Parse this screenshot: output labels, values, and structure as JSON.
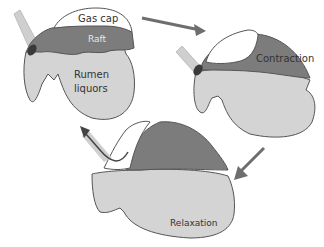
{
  "diagram": {
    "colors": {
      "liquor": "#d4d4d4",
      "raft": "#7c7c7c",
      "gas": "#ffffff",
      "esophagus": "#cfcfcf",
      "cardia": "#3a3a3a",
      "outline": "#555555",
      "arrow": "#6e6e6e",
      "text": "#333333",
      "raft_text": "#e6e6e6"
    },
    "stages": [
      {
        "name": "Resting",
        "labels": {
          "gas": "Gas cap",
          "raft": "Raft",
          "liquor_line1": "Rumen",
          "liquor_line2": "liquors"
        }
      },
      {
        "name": "Contraction",
        "labels": {
          "main": "Contraction"
        }
      },
      {
        "name": "Relaxation",
        "labels": {
          "main": "Relaxation"
        }
      }
    ],
    "arrows": [
      {
        "from": "Resting",
        "to": "Contraction",
        "direction": "right"
      },
      {
        "from": "Contraction",
        "to": "Relaxation",
        "direction": "down-left"
      },
      {
        "from": "Relaxation",
        "to": "esophagus",
        "direction": "up-left",
        "meaning": "eructation"
      }
    ]
  }
}
